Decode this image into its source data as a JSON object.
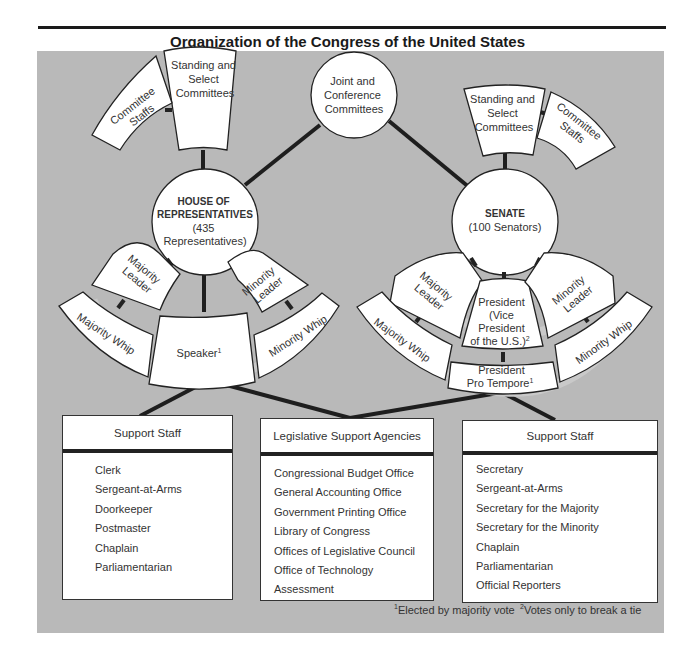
{
  "title": "Organization of the Congress of the United States",
  "joint": {
    "lines": [
      "Joint and",
      "Conference",
      "Committees"
    ]
  },
  "house": {
    "name": "HOUSE OF",
    "name2": "REPRESENTATIVES",
    "sub1": "(435",
    "sub2": "Representatives)",
    "committees": {
      "standing": [
        "Standing and",
        "Select",
        "Committees"
      ],
      "staffs": [
        "Committee",
        "Staffs"
      ]
    },
    "leadership": {
      "majority_leader": [
        "Majority",
        "Leader"
      ],
      "majority_whip": "Majority Whip",
      "speaker": "Speaker",
      "speaker_note": "1",
      "minority_leader": [
        "Minority",
        "Leader"
      ],
      "minority_whip": "Minority Whip"
    },
    "support_staff": {
      "header": "Support Staff",
      "items": [
        "Clerk",
        "Sergeant-at-Arms",
        "Doorkeeper",
        "Postmaster",
        "Chaplain",
        "Parliamentarian"
      ]
    }
  },
  "senate": {
    "name": "SENATE",
    "sub": "(100 Senators)",
    "committees": {
      "standing": [
        "Standing and",
        "Select",
        "Committees"
      ],
      "staffs": [
        "Committee",
        "Staffs"
      ]
    },
    "leadership": {
      "majority_leader": [
        "Majority",
        "Leader"
      ],
      "majority_whip": "Majority Whip",
      "president": [
        "President",
        "(Vice",
        "President",
        "of the U.S.)"
      ],
      "president_note": "2",
      "pro_tempore": [
        "President",
        "Pro Tempore"
      ],
      "pro_tempore_note": "1",
      "minority_leader": [
        "Minority",
        "Leader"
      ],
      "minority_whip": "Minority Whip"
    },
    "support_staff": {
      "header": "Support Staff",
      "items": [
        "Secretary",
        "Sergeant-at-Arms",
        "Secretary for the Majority",
        "Secretary for the Minority",
        "Chaplain",
        "Parliamentarian",
        "Official Reporters"
      ]
    }
  },
  "agencies": {
    "header": "Legislative Support Agencies",
    "items": [
      "Congressional Budget Office",
      "General Accounting Office",
      "Government Printing Office",
      "Library of Congress",
      "Offices of Legislative Council",
      "Office of Technology Assessment"
    ]
  },
  "footnotes": {
    "n1_mark": "1",
    "n1_text": "Elected by majority vote",
    "n2_mark": "2",
    "n2_text": "Votes only to break a tie"
  },
  "colors": {
    "panel": "#b9b9b9",
    "node_fill": "#ffffff",
    "stroke": "#222222",
    "text": "#333333"
  }
}
